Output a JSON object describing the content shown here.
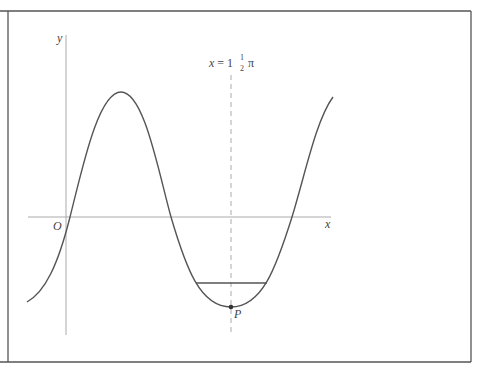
{
  "diagram": {
    "type": "graph-sketch",
    "labels": {
      "y_axis": "y",
      "x_axis": "x",
      "origin": "O",
      "point": "P",
      "line_lhs": "x = 1",
      "line_frac_num": "1",
      "line_frac_den": "2",
      "line_pi": "π"
    },
    "colors": {
      "curve": "#555555",
      "axes": "#aaaaaa",
      "border": "#555555",
      "dashed_line": "#aaaaaa",
      "chord": "#555555",
      "point": "#333333"
    },
    "elements": {
      "vertical_line": "x = 1½π (dashed)",
      "minimum_point": "P",
      "chord": "horizontal line segment across trough"
    }
  }
}
